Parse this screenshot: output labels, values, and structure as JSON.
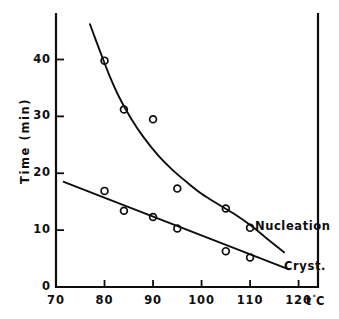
{
  "chart_data": {
    "type": "scatter",
    "title": "",
    "xlabel": "t °C",
    "ylabel": "Time (min)",
    "xlim": [
      70,
      124
    ],
    "ylim": [
      0,
      48
    ],
    "xticks": [
      "70",
      "80",
      "90",
      "100",
      "110",
      "120"
    ],
    "xtick_values": [
      70,
      80,
      90,
      100,
      110,
      120
    ],
    "yticks": [
      "0",
      "10",
      "20",
      "30",
      "40"
    ],
    "ytick_values": [
      0,
      10,
      20,
      30,
      40
    ],
    "grid": false,
    "legend_position": "inline-right-of-curves",
    "series": [
      {
        "name": "Nucleation",
        "label": "Nucleation",
        "marker": "open-circle",
        "x": [
          80,
          84,
          90,
          95,
          105,
          110
        ],
        "values": [
          39.8,
          31.2,
          29.5,
          17.3,
          13.8,
          10.4
        ],
        "fit_curve": [
          [
            77.0,
            46.2
          ],
          [
            79.0,
            41.6
          ],
          [
            81.0,
            37.2
          ],
          [
            83.0,
            33.4
          ],
          [
            85.5,
            29.6
          ],
          [
            88.0,
            26.4
          ],
          [
            91.0,
            23.2
          ],
          [
            94.0,
            20.6
          ],
          [
            97.0,
            18.4
          ],
          [
            100.0,
            16.4
          ],
          [
            103.5,
            14.5
          ],
          [
            107.0,
            12.7
          ],
          [
            110.5,
            10.6
          ],
          [
            113.5,
            8.5
          ],
          [
            117.0,
            6.1
          ]
        ]
      },
      {
        "name": "Cryst.",
        "label": "Cryst.",
        "marker": "open-circle",
        "x": [
          80,
          84,
          90,
          95,
          105,
          110
        ],
        "values": [
          16.9,
          13.4,
          12.3,
          10.3,
          6.3,
          5.2
        ],
        "fit_curve": [
          [
            71.6,
            18.5
          ],
          [
            118.0,
            3.1
          ]
        ]
      }
    ],
    "annotations": [
      {
        "text": "Nucleation",
        "x": 111.0,
        "y": 10.6
      },
      {
        "text": "Cryst.",
        "x": 117.0,
        "y": 3.6
      }
    ]
  },
  "axes": {
    "y_title": "Time (min)",
    "x_unit_symbol": "t",
    "x_unit_degree": "°",
    "x_unit_scale": "C"
  },
  "colors": {
    "ink": "#0d0d0d",
    "background": "#ffffff"
  }
}
